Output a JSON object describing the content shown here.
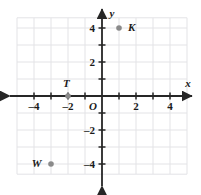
{
  "chart_data": {
    "type": "scatter",
    "title": "",
    "xlabel": "x",
    "ylabel": "y",
    "xlim": [
      -5,
      5
    ],
    "ylim": [
      -5,
      5
    ],
    "grid": true,
    "grid_step": 1,
    "legend": "none",
    "origin_label": "O",
    "x_ticks": [
      -4,
      -2,
      2,
      4
    ],
    "x_tick_labels": [
      "–4",
      "–2",
      "2",
      "4"
    ],
    "y_ticks": [
      4,
      2,
      -2,
      -4
    ],
    "y_tick_labels": [
      "4",
      "2",
      "–2",
      "–4"
    ],
    "points": [
      {
        "label": "K",
        "x": 1,
        "y": 4,
        "label_dx": 0.75,
        "label_dy": 0.05
      },
      {
        "label": "T",
        "x": -2,
        "y": 0,
        "label_dx": -0.1,
        "label_dy": 0.78
      },
      {
        "label": "W",
        "x": -3,
        "y": -4,
        "label_dx": -0.85,
        "label_dy": 0.05
      }
    ]
  },
  "axes": {
    "x_axis_name": "x",
    "y_axis_name": "y"
  },
  "colors": {
    "grid": "#e3e3e6",
    "axis": "#262626",
    "point": "#8a8a8a",
    "text": "#1a1a1a",
    "background": "#ffffff"
  }
}
